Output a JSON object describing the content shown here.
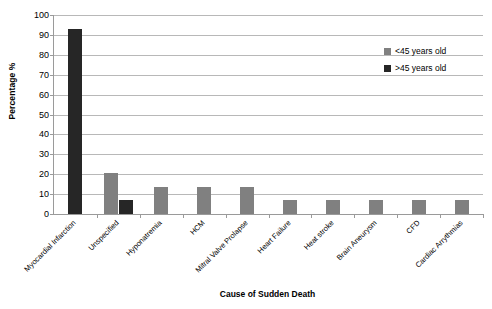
{
  "chart_data": {
    "type": "bar",
    "title": "",
    "xlabel": "Cause of Sudden Death",
    "ylabel": "Percentage %",
    "ylim": [
      0,
      100
    ],
    "ytick_step": 10,
    "ytick_labels": [
      "0",
      "10",
      "20",
      "30",
      "40",
      "50",
      "60",
      "70",
      "80",
      "90",
      "100"
    ],
    "grid": "horizontal",
    "legend_position": "upper-right-inside",
    "categories": [
      "Myocardial Infarction",
      "Unspecified",
      "Hyponatremia",
      "HCM",
      "Mitral Valve Prolapse",
      "Heart Failure",
      "Heat stroke",
      "Brain Aneurysm",
      "CFD",
      "Cardiac Arrythmias"
    ],
    "series": [
      {
        "name": "<45 years old",
        "color": "#808080",
        "values": [
          0,
          20.5,
          13.7,
          13.7,
          13.7,
          6.8,
          6.8,
          6.8,
          6.8,
          6.8
        ]
      },
      {
        "name": ">45 years old",
        "color": "#262626",
        "values": [
          93,
          6.8,
          0,
          0,
          0,
          0,
          0,
          0,
          0,
          0
        ]
      }
    ]
  },
  "legend": {
    "entries": [
      {
        "label": "<45 years old",
        "color": "#808080"
      },
      {
        "label": ">45 years old",
        "color": "#262626"
      }
    ]
  },
  "axes": {
    "x_title": "Cause of Sudden Death",
    "y_title": "Percentage %"
  }
}
